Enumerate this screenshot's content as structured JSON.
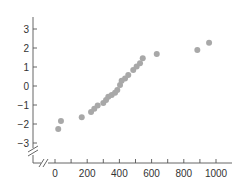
{
  "chart_data": {
    "type": "scatter",
    "title": "",
    "xlabel": "",
    "ylabel": "",
    "xlim": [
      0,
      1000
    ],
    "ylim": [
      -3,
      3
    ],
    "x_ticks": [
      0,
      200,
      400,
      600,
      800,
      1000
    ],
    "x_minor_ticks": [
      100,
      300,
      500,
      700,
      900
    ],
    "y_ticks": [
      3,
      2,
      1,
      0,
      -1,
      -2,
      -3
    ],
    "y_tick_labels": [
      "3",
      "2",
      "1",
      "0",
      "−1",
      "−2",
      "−3"
    ],
    "grid": false,
    "legend": null,
    "axis_breaks": {
      "x": true,
      "y": true
    },
    "marker_color": "#a8a8a8",
    "points": [
      {
        "x": 20,
        "y": -2.26
      },
      {
        "x": 37,
        "y": -1.84
      },
      {
        "x": 166,
        "y": -1.65
      },
      {
        "x": 224,
        "y": -1.37
      },
      {
        "x": 244,
        "y": -1.2
      },
      {
        "x": 265,
        "y": -1.03
      },
      {
        "x": 300,
        "y": -0.9
      },
      {
        "x": 317,
        "y": -0.74
      },
      {
        "x": 331,
        "y": -0.56
      },
      {
        "x": 352,
        "y": -0.47
      },
      {
        "x": 373,
        "y": -0.35
      },
      {
        "x": 387,
        "y": -0.21
      },
      {
        "x": 404,
        "y": 0.05
      },
      {
        "x": 414,
        "y": 0.28
      },
      {
        "x": 435,
        "y": 0.4
      },
      {
        "x": 455,
        "y": 0.58
      },
      {
        "x": 486,
        "y": 0.84
      },
      {
        "x": 507,
        "y": 1.02
      },
      {
        "x": 528,
        "y": 1.2
      },
      {
        "x": 545,
        "y": 1.46
      },
      {
        "x": 632,
        "y": 1.68
      },
      {
        "x": 884,
        "y": 1.89
      },
      {
        "x": 957,
        "y": 2.28
      }
    ]
  }
}
